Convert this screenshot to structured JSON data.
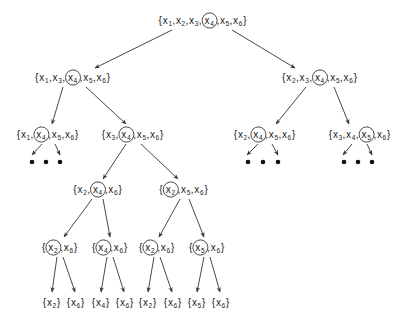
{
  "diagram": {
    "type": "search-tree",
    "colors": {
      "text": "#1a1a1a",
      "edge": "#333333",
      "background": "#ffffff"
    },
    "nodes": [
      {
        "id": "root",
        "cx": 203,
        "cy": 20,
        "elements": [
          "1",
          "2",
          "3",
          "4",
          "5",
          "6"
        ],
        "circled": "4"
      },
      {
        "id": "L1a",
        "cx": 73,
        "cy": 77,
        "elements": [
          "1",
          "3",
          "4",
          "5",
          "6"
        ],
        "circled": "4"
      },
      {
        "id": "L1b",
        "cx": 320,
        "cy": 77,
        "elements": [
          "2",
          "3",
          "4",
          "5",
          "6"
        ],
        "circled": "4"
      },
      {
        "id": "L2a",
        "cx": 48,
        "cy": 134,
        "elements": [
          "1",
          "4",
          "5",
          "6"
        ],
        "circled": "4"
      },
      {
        "id": "L2b",
        "cx": 133,
        "cy": 134,
        "elements": [
          "3",
          "4",
          "5",
          "6"
        ],
        "circled": "4"
      },
      {
        "id": "L2c",
        "cx": 265,
        "cy": 134,
        "elements": [
          "2",
          "4",
          "5",
          "6"
        ],
        "circled": "4"
      },
      {
        "id": "L2d",
        "cx": 360,
        "cy": 134,
        "elements": [
          "3",
          "4",
          "5",
          "6"
        ],
        "circled": "5"
      },
      {
        "id": "L3a",
        "cx": 98,
        "cy": 189,
        "elements": [
          "2",
          "4",
          "6"
        ],
        "circled": "4"
      },
      {
        "id": "L3b",
        "cx": 184,
        "cy": 189,
        "elements": [
          "2",
          "5",
          "6"
        ],
        "circled": "2"
      },
      {
        "id": "L4a",
        "cx": 60,
        "cy": 247,
        "elements": [
          "2",
          "6"
        ],
        "circled": "2"
      },
      {
        "id": "L4b",
        "cx": 110,
        "cy": 247,
        "elements": [
          "4",
          "6"
        ],
        "circled": "4"
      },
      {
        "id": "L4c",
        "cx": 157,
        "cy": 247,
        "elements": [
          "2",
          "6"
        ],
        "circled": "2"
      },
      {
        "id": "L4d",
        "cx": 207,
        "cy": 247,
        "elements": [
          "5",
          "6"
        ],
        "circled": "5"
      },
      {
        "id": "leaf1",
        "cx": 52,
        "cy": 302,
        "elements": [
          "2"
        ],
        "circled": null
      },
      {
        "id": "leaf2",
        "cx": 76,
        "cy": 302,
        "elements": [
          "6"
        ],
        "circled": null
      },
      {
        "id": "leaf3",
        "cx": 101,
        "cy": 302,
        "elements": [
          "4"
        ],
        "circled": null
      },
      {
        "id": "leaf4",
        "cx": 125,
        "cy": 302,
        "elements": [
          "6"
        ],
        "circled": null
      },
      {
        "id": "leaf5",
        "cx": 148,
        "cy": 302,
        "elements": [
          "2"
        ],
        "circled": null
      },
      {
        "id": "leaf6",
        "cx": 173,
        "cy": 302,
        "elements": [
          "6"
        ],
        "circled": null
      },
      {
        "id": "leaf7",
        "cx": 197,
        "cy": 302,
        "elements": [
          "5"
        ],
        "circled": null
      },
      {
        "id": "leaf8",
        "cx": 221,
        "cy": 302,
        "elements": [
          "6"
        ],
        "circled": null
      }
    ],
    "edges": [
      {
        "from": [
          172,
          30
        ],
        "to": [
          95,
          68
        ]
      },
      {
        "from": [
          232,
          30
        ],
        "to": [
          295,
          68
        ]
      },
      {
        "from": [
          63,
          87
        ],
        "to": [
          52,
          124
        ]
      },
      {
        "from": [
          86,
          87
        ],
        "to": [
          126,
          124
        ]
      },
      {
        "from": [
          306,
          87
        ],
        "to": [
          276,
          124
        ]
      },
      {
        "from": [
          334,
          87
        ],
        "to": [
          349,
          124
        ]
      },
      {
        "from": [
          126,
          144
        ],
        "to": [
          103,
          179
        ]
      },
      {
        "from": [
          141,
          144
        ],
        "to": [
          178,
          179
        ]
      },
      {
        "from": [
          92,
          199
        ],
        "to": [
          64,
          237
        ]
      },
      {
        "from": [
          103,
          199
        ],
        "to": [
          110,
          237
        ]
      },
      {
        "from": [
          180,
          199
        ],
        "to": [
          159,
          237
        ]
      },
      {
        "from": [
          189,
          199
        ],
        "to": [
          204,
          237
        ]
      },
      {
        "from": [
          57,
          257
        ],
        "to": [
          52,
          292
        ]
      },
      {
        "from": [
          63,
          257
        ],
        "to": [
          75,
          292
        ]
      },
      {
        "from": [
          107,
          257
        ],
        "to": [
          101,
          292
        ]
      },
      {
        "from": [
          113,
          257
        ],
        "to": [
          124,
          292
        ]
      },
      {
        "from": [
          154,
          257
        ],
        "to": [
          148,
          292
        ]
      },
      {
        "from": [
          160,
          257
        ],
        "to": [
          172,
          292
        ]
      },
      {
        "from": [
          204,
          257
        ],
        "to": [
          197,
          292
        ]
      },
      {
        "from": [
          210,
          257
        ],
        "to": [
          220,
          292
        ]
      }
    ],
    "dot_edges": [
      {
        "from": [
          42,
          144
        ],
        "to": [
          32,
          155
        ]
      },
      {
        "from": [
          55,
          144
        ],
        "to": [
          60,
          155
        ]
      },
      {
        "from": [
          258,
          144
        ],
        "to": [
          247,
          155
        ]
      },
      {
        "from": [
          272,
          144
        ],
        "to": [
          278,
          155
        ]
      },
      {
        "from": [
          352,
          144
        ],
        "to": [
          343,
          155
        ]
      },
      {
        "from": [
          367,
          144
        ],
        "to": [
          372,
          155
        ]
      }
    ],
    "ellipsis_groups": [
      {
        "y": 162,
        "xs": [
          32,
          46,
          60
        ]
      },
      {
        "y": 162,
        "xs": [
          248,
          263,
          278
        ]
      },
      {
        "y": 162,
        "xs": [
          344,
          358,
          372
        ]
      }
    ]
  }
}
